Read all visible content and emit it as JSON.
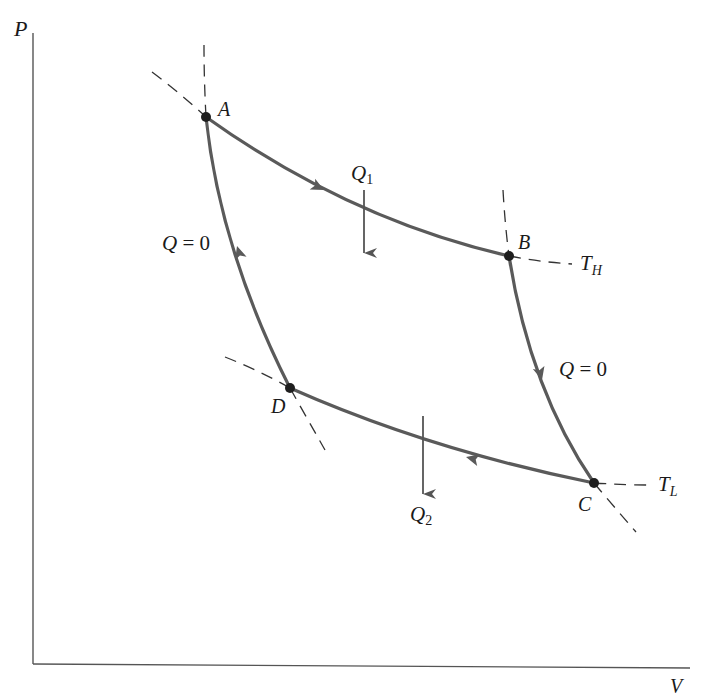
{
  "figure": {
    "type": "pv-diagram"
  },
  "axes": {
    "y_label": "P",
    "x_label": "V"
  },
  "points": {
    "A": {
      "label": "A",
      "x": 206,
      "y": 117
    },
    "B": {
      "label": "B",
      "x": 509,
      "y": 256
    },
    "C": {
      "label": "C",
      "x": 594,
      "y": 483
    },
    "D": {
      "label": "D",
      "x": 290,
      "y": 388
    }
  },
  "processes": [
    {
      "from": "A",
      "to": "B",
      "kind": "isothermal expansion",
      "temperature": "T_H",
      "heat": "Q1 in"
    },
    {
      "from": "B",
      "to": "C",
      "kind": "adiabatic expansion",
      "heat": "Q = 0"
    },
    {
      "from": "C",
      "to": "D",
      "kind": "isothermal compression",
      "temperature": "T_L",
      "heat": "Q2 out"
    },
    {
      "from": "D",
      "to": "A",
      "kind": "adiabatic compression",
      "heat": "Q = 0"
    }
  ],
  "labels": {
    "q1": {
      "main": "Q",
      "sub": "1"
    },
    "q2": {
      "main": "Q",
      "sub": "2"
    },
    "th": {
      "main": "T",
      "sub": "H"
    },
    "tl": {
      "main": "T",
      "sub": "L"
    },
    "adiabat_left": {
      "q": "Q",
      "eq": " = 0"
    },
    "adiabat_right": {
      "q": "Q",
      "eq": " = 0"
    }
  },
  "colors": {
    "process_line": "#5a5a5a",
    "dashed_line": "#333333",
    "point": "#1e1e1e",
    "background": "#ffffff"
  }
}
